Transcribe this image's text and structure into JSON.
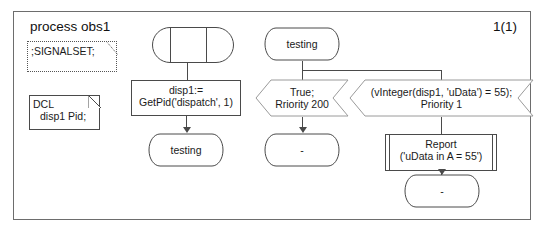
{
  "diagram": {
    "type": "sdl-process-diagram",
    "title": "process obs1",
    "page_number": "1(1)",
    "frame": {
      "stroke": "#6d6d6d"
    },
    "text_declarations": {
      "signalset": ";SIGNALSET;",
      "dcl_keyword": "DCL",
      "dcl_body": "disp1 Pid;"
    },
    "nodes": {
      "start_symbol": {
        "label": ""
      },
      "task": {
        "line1": "disp1:=",
        "line2": "GetPid('dispatch', 1)"
      },
      "state_testing_after_task": {
        "label": "testing"
      },
      "state_testing_source": {
        "label": "testing"
      },
      "input_true": {
        "line1": "True;",
        "line2": "Rriority 200"
      },
      "input_vinteger": {
        "line1": "(vInteger(disp1, 'uData') = 55);",
        "line2": "Priority 1"
      },
      "procedure_report": {
        "line1": "Report",
        "line2": "('uData in A = 55')"
      },
      "state_dash_after_true": {
        "label": "-"
      },
      "state_dash_after_report": {
        "label": "-"
      }
    },
    "colors": {
      "stroke": "#4a4a4a",
      "frame_stroke": "#6d6d6d",
      "text": "#1a1a1a",
      "background": "#ffffff",
      "dotted_stroke": "#555555"
    }
  }
}
